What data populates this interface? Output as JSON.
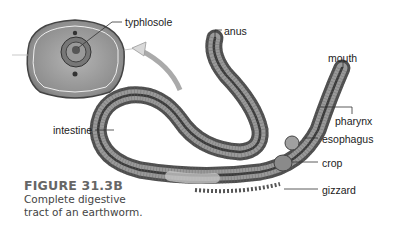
{
  "figure": {
    "title": "FIGURE 31.3B",
    "caption_line1": "Complete digestive",
    "caption_line2": "tract of an earthworm."
  },
  "labels": {
    "typhlosole": "typhlosole",
    "anus": "anus",
    "mouth": "mouth",
    "pharynx": "pharynx",
    "esophagus": "esophagus",
    "crop": "crop",
    "gizzard": "gizzard",
    "intestine": "intestine"
  },
  "colors": {
    "worm_dark": "#4a4a4a",
    "worm_mid": "#8a8a8a",
    "worm_light": "#bdbdbd",
    "cross_section_fill": "#9c9c9c",
    "caption_title": "#666666"
  }
}
